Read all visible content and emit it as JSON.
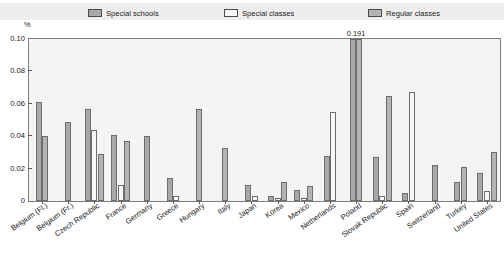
{
  "legend": {
    "items": [
      {
        "label": "Special schools",
        "color": "#a8a8a8",
        "swatch_icon": "legend-swatch-icon"
      },
      {
        "label": "Special classes",
        "color": "#f7f7f5",
        "swatch_icon": "legend-swatch-icon"
      },
      {
        "label": "Regular classes",
        "color": "#b4b4b4",
        "swatch_icon": "legend-swatch-icon"
      }
    ]
  },
  "axis": {
    "y_unit": "%",
    "y_ticks": [
      "0.10",
      "0.08",
      "0.06",
      "0.04",
      "0.02",
      "0"
    ]
  },
  "chart_data": {
    "type": "bar",
    "title": "",
    "subtitle": "",
    "xlabel": "",
    "ylabel": "%",
    "ylim": [
      0,
      0.1
    ],
    "ytick_values": [
      0,
      0.02,
      0.04,
      0.06,
      0.08,
      0.1
    ],
    "grid": false,
    "legend_position": "top",
    "categories": [
      "Belgium (Fl.)",
      "Belgium (Fr.)",
      "Czech Republic",
      "France",
      "Germany",
      "Greece",
      "Hungary",
      "Italy",
      "Japan",
      "Korea",
      "Mexico",
      "Netherlands",
      "Poland",
      "Slovak Republic",
      "Spain",
      "Switzerland",
      "Turkey",
      "United States"
    ],
    "series": [
      {
        "name": "Special schools",
        "color": "#a8a8a8",
        "values": [
          0.061,
          0.049,
          0.057,
          0.041,
          0.04,
          0.014,
          null,
          null,
          0.01,
          0.003,
          0.007,
          0.028,
          0.1,
          0.027,
          0.005,
          0.022,
          0.012,
          0.017
        ]
      },
      {
        "name": "Special classes",
        "color": "#f7f7f5",
        "values": [
          null,
          null,
          0.044,
          0.01,
          null,
          0.003,
          null,
          null,
          0.003,
          0.002,
          0.002,
          0.055,
          null,
          0.003,
          0.067,
          null,
          null,
          0.006
        ]
      },
      {
        "name": "Regular classes",
        "color": "#b4b4b4",
        "values": [
          0.04,
          null,
          0.029,
          0.037,
          null,
          null,
          0.057,
          0.033,
          null,
          0.012,
          0.009,
          null,
          0.191,
          0.065,
          null,
          null,
          0.021,
          0.03
        ]
      }
    ],
    "annotations": [
      {
        "text": "0.191",
        "category": "Poland",
        "series": "Regular classes",
        "value": 0.191
      }
    ]
  }
}
